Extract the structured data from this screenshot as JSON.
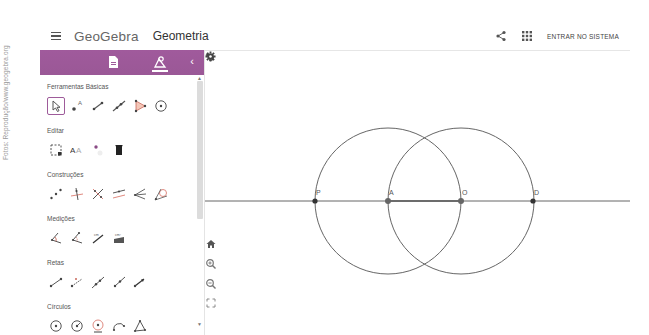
{
  "credit": "Fotos: Reprodução/www.geogebra.org",
  "header": {
    "brand": "GeoGebra",
    "app_name": "Geometria",
    "login_label": "ENTRAR NO SISTEMA",
    "icons": [
      "menu-icon",
      "share-icon",
      "apps-grid-icon"
    ]
  },
  "panel": {
    "accent_color": "#9e5b9a",
    "tabs": [
      {
        "name": "algebra-tab",
        "icon": "document-icon",
        "active": false
      },
      {
        "name": "tools-tab",
        "icon": "tools-icon",
        "active": true
      }
    ],
    "categories": [
      {
        "label": "Ferramentas Básicas",
        "tools": [
          "move",
          "point",
          "segment",
          "line",
          "polygon",
          "circle-center-point"
        ]
      },
      {
        "label": "Editar",
        "tools": [
          "select-objects",
          "text-style",
          "show-hide-label",
          "delete"
        ]
      },
      {
        "label": "Construções",
        "tools": [
          "midpoint",
          "perpendicular-line",
          "perpendicular-bisector",
          "parallel-line",
          "angle-bisector",
          "tangents"
        ]
      },
      {
        "label": "Medições",
        "tools": [
          "angle",
          "angle-given-size",
          "distance",
          "area"
        ]
      },
      {
        "label": "Retas",
        "tools": [
          "segment",
          "segment-fixed-length",
          "line",
          "ray",
          "vector"
        ]
      },
      {
        "label": "Círculos",
        "tools": [
          "circle-center-point",
          "circle-center-radius",
          "compass",
          "semicircle",
          "circle-three-points"
        ]
      }
    ]
  },
  "graphics": {
    "points": [
      {
        "label": "P",
        "x": 110,
        "y": 150,
        "color": "#333333"
      },
      {
        "label": "A",
        "x": 183,
        "y": 150,
        "color": "#666666"
      },
      {
        "label": "O",
        "x": 256,
        "y": 150,
        "color": "#666666"
      },
      {
        "label": "D",
        "x": 328,
        "y": 150,
        "color": "#333333"
      }
    ],
    "circles": [
      {
        "center": "A",
        "radius": 73
      },
      {
        "center": "O",
        "radius": 73
      }
    ],
    "line_through": [
      "P",
      "D"
    ],
    "controls": [
      "undo-icon",
      "settings-icon",
      "home-icon",
      "zoom-in-icon",
      "zoom-out-icon",
      "fullscreen-icon"
    ]
  }
}
